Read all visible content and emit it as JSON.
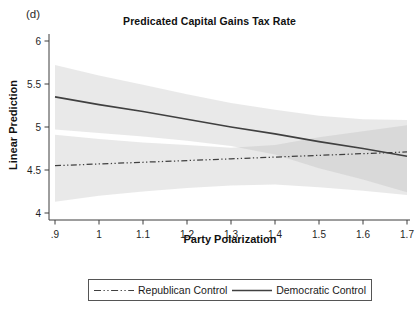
{
  "figure_label": "(d)",
  "chart_data": {
    "type": "line",
    "title": "Predicated Capital Gains Tax Rate",
    "xlabel": "Party Polarization",
    "ylabel": "Linear Prediction",
    "xlim": [
      0.9,
      1.7
    ],
    "ylim": [
      4,
      6
    ],
    "grid": false,
    "legend_position": "bottom",
    "x_ticks": [
      ".9",
      "1",
      "1.1",
      "1.2",
      "1.3",
      "1.4",
      "1.5",
      "1.6",
      "1.7"
    ],
    "x_tick_values": [
      0.9,
      1.0,
      1.1,
      1.2,
      1.3,
      1.4,
      1.5,
      1.6,
      1.7
    ],
    "y_ticks": [
      "4",
      "4.5",
      "5",
      "5.5",
      "6"
    ],
    "y_tick_values": [
      4,
      4.5,
      5,
      5.5,
      6
    ],
    "x": [
      0.9,
      1.0,
      1.1,
      1.2,
      1.3,
      1.4,
      1.5,
      1.6,
      1.7
    ],
    "series": [
      {
        "name": "Republican Control",
        "style": "dash_dot_dot",
        "values": [
          4.55,
          4.57,
          4.59,
          4.61,
          4.63,
          4.65,
          4.67,
          4.69,
          4.71
        ],
        "ci_upper": [
          4.91,
          4.86,
          4.82,
          4.79,
          4.76,
          4.79,
          4.88,
          4.95,
          5.02
        ],
        "ci_lower": [
          4.13,
          4.2,
          4.25,
          4.29,
          4.32,
          4.33,
          4.3,
          4.26,
          4.21
        ]
      },
      {
        "name": "Democratic Control",
        "style": "solid",
        "values": [
          5.35,
          5.26,
          5.18,
          5.09,
          5.0,
          4.92,
          4.83,
          4.75,
          4.66
        ],
        "ci_upper": [
          5.72,
          5.6,
          5.49,
          5.38,
          5.28,
          5.2,
          5.13,
          5.09,
          5.08
        ],
        "ci_lower": [
          4.97,
          4.93,
          4.89,
          4.84,
          4.78,
          4.68,
          4.52,
          4.39,
          4.24
        ]
      }
    ],
    "colors": {
      "line": "#404040",
      "axis": "#3d3d3d",
      "band_fill": "#b0b0b0",
      "band_opacity": 0.28,
      "text": "#1a1a1a"
    }
  },
  "legend": {
    "items": [
      {
        "label": "Republican Control",
        "style": "dash_dot_dot"
      },
      {
        "label": "Democratic Control",
        "style": "solid"
      }
    ]
  }
}
